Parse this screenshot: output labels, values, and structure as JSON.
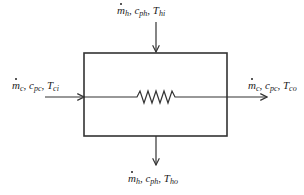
{
  "diagram": {
    "type": "heat-exchanger-schematic",
    "box": {
      "x": 84,
      "y": 53,
      "width": 143,
      "height": 83
    },
    "element": "resistor-zigzag",
    "inlets_outlets": {
      "hot_in": {
        "m": "m",
        "m_sub": "h",
        "c": "c",
        "c_sub": "ph",
        "T": "T",
        "T_sub": "hi",
        "direction": "down-into-top"
      },
      "hot_out": {
        "m": "m",
        "m_sub": "h",
        "c": "c",
        "c_sub": "ph",
        "T": "T",
        "T_sub": "ho",
        "direction": "down-out-bottom"
      },
      "cold_in": {
        "m": "m",
        "m_sub": "c",
        "c": "c",
        "c_sub": "pc",
        "T": "T",
        "T_sub": "ci",
        "direction": "right-into-left"
      },
      "cold_out": {
        "m": "m",
        "m_sub": "c",
        "c": "c",
        "c_sub": "pc",
        "T": "T",
        "T_sub": "co",
        "direction": "right-out-right"
      }
    },
    "separator": ", ",
    "colors": {
      "line": "#333333",
      "text": "#222222",
      "background": "#ffffff"
    }
  }
}
